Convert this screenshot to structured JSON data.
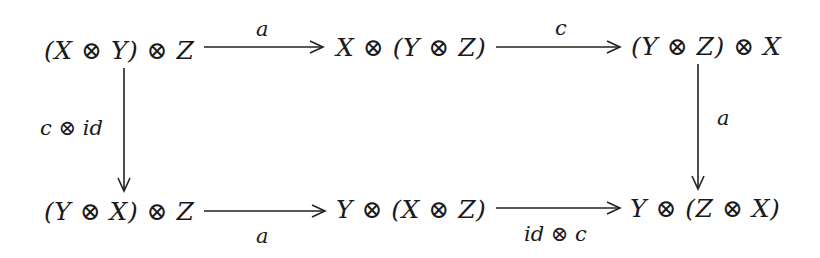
{
  "diagram": {
    "type": "commutative-diagram",
    "nodes": {
      "top_left": "(X ⊗ Y) ⊗ Z",
      "top_middle": "X ⊗ (Y ⊗ Z)",
      "top_right": "(Y ⊗ Z) ⊗ X",
      "bottom_left": "(Y ⊗ X) ⊗ Z",
      "bottom_middle": "Y ⊗ (X ⊗ Z)",
      "bottom_right": "Y ⊗ (Z ⊗ X)"
    },
    "arrows": [
      {
        "from": "top_left",
        "to": "top_middle",
        "label": "a"
      },
      {
        "from": "top_middle",
        "to": "top_right",
        "label": "c"
      },
      {
        "from": "top_left",
        "to": "bottom_left",
        "label": "c ⊗ id"
      },
      {
        "from": "top_right",
        "to": "bottom_right",
        "label": "a"
      },
      {
        "from": "bottom_left",
        "to": "bottom_middle",
        "label": "a"
      },
      {
        "from": "bottom_middle",
        "to": "bottom_right",
        "label": "id ⊗ c"
      }
    ]
  }
}
